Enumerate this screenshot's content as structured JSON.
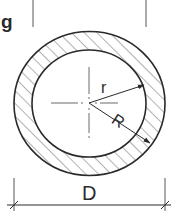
{
  "diagram": {
    "partial_heading_text": "g",
    "labels": {
      "inner_radius": "r",
      "outer_radius": "R",
      "outer_diameter": "D"
    },
    "colors": {
      "line": "#2a2a2a",
      "hatch": "#555555",
      "background": "#ffffff"
    },
    "hatch_style": "diagonal 45°",
    "center_mark": "dash-dot crosshair"
  }
}
